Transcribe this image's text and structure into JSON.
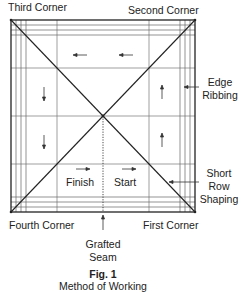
{
  "figure": {
    "number": "Fig. 1",
    "caption": "Method of Working"
  },
  "corners": {
    "third": "Third Corner",
    "second": "Second Corner",
    "fourth": "Fourth Corner",
    "first": "First Corner"
  },
  "callouts": {
    "edge_ribbing": [
      "Edge",
      "Ribbing"
    ],
    "short_row_shaping": [
      "Short",
      "Row",
      "Shaping"
    ],
    "grafted_seam": [
      "Grafted",
      "Seam"
    ]
  },
  "inner_labels": {
    "finish": "Finish",
    "start": "Start"
  },
  "colors": {
    "line": "#222222",
    "grid": "#666666",
    "background": "#ffffff"
  }
}
